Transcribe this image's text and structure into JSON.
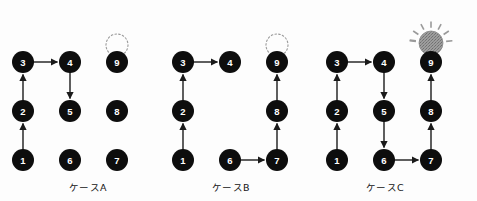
{
  "figure": {
    "background_color": "#fdfdfd",
    "node_fill": "#0d0d0d",
    "node_label_color": "#ffffff",
    "edge_color": "#1a1a1a",
    "dashed_circle_color": "#9a9a9a",
    "bulb_fill": "#8f8f8f",
    "bulb_ray_color": "#9a9a9a",
    "node_radius": 11,
    "dashed_radius": 11,
    "bulb_radius": 12
  },
  "cases": [
    {
      "id": "A",
      "label": "ケースA",
      "label_x": 88,
      "label_y": 180,
      "origin_x": 23,
      "origin_y": 160,
      "col_gap": 47,
      "row_gap": 49,
      "nodes": [
        {
          "id": "1",
          "label": "1",
          "col": 0,
          "row": 0
        },
        {
          "id": "2",
          "label": "2",
          "col": 0,
          "row": 1
        },
        {
          "id": "3",
          "label": "3",
          "col": 0,
          "row": 2
        },
        {
          "id": "4",
          "label": "4",
          "col": 1,
          "row": 2
        },
        {
          "id": "5",
          "label": "5",
          "col": 1,
          "row": 1
        },
        {
          "id": "6",
          "label": "6",
          "col": 1,
          "row": 0
        },
        {
          "id": "7",
          "label": "7",
          "col": 2,
          "row": 0
        },
        {
          "id": "8",
          "label": "8",
          "col": 2,
          "row": 1
        },
        {
          "id": "9",
          "label": "9",
          "col": 2,
          "row": 2
        }
      ],
      "edges": [
        {
          "from": "1",
          "to": "2"
        },
        {
          "from": "2",
          "to": "3"
        },
        {
          "from": "3",
          "to": "4"
        },
        {
          "from": "4",
          "to": "5"
        }
      ],
      "marker": "dashed-circle",
      "marker_node": "9"
    },
    {
      "id": "B",
      "label": "ケースB",
      "label_x": 231,
      "label_y": 180,
      "origin_x": 183,
      "origin_y": 160,
      "col_gap": 47,
      "row_gap": 49,
      "nodes": [
        {
          "id": "1",
          "label": "1",
          "col": 0,
          "row": 0
        },
        {
          "id": "2",
          "label": "2",
          "col": 0,
          "row": 1
        },
        {
          "id": "3",
          "label": "3",
          "col": 0,
          "row": 2
        },
        {
          "id": "4",
          "label": "4",
          "col": 1,
          "row": 2
        },
        {
          "id": "6",
          "label": "6",
          "col": 1,
          "row": 0
        },
        {
          "id": "7",
          "label": "7",
          "col": 2,
          "row": 0
        },
        {
          "id": "8",
          "label": "8",
          "col": 2,
          "row": 1
        },
        {
          "id": "9",
          "label": "9",
          "col": 2,
          "row": 2
        }
      ],
      "edges": [
        {
          "from": "1",
          "to": "2"
        },
        {
          "from": "2",
          "to": "3"
        },
        {
          "from": "3",
          "to": "4"
        },
        {
          "from": "6",
          "to": "7"
        },
        {
          "from": "7",
          "to": "8"
        },
        {
          "from": "8",
          "to": "9"
        }
      ],
      "marker": "dashed-circle",
      "marker_node": "9"
    },
    {
      "id": "C",
      "label": "ケースC",
      "label_x": 385,
      "label_y": 180,
      "origin_x": 337,
      "origin_y": 160,
      "col_gap": 47,
      "row_gap": 49,
      "nodes": [
        {
          "id": "1",
          "label": "1",
          "col": 0,
          "row": 0
        },
        {
          "id": "2",
          "label": "2",
          "col": 0,
          "row": 1
        },
        {
          "id": "3",
          "label": "3",
          "col": 0,
          "row": 2
        },
        {
          "id": "4",
          "label": "4",
          "col": 1,
          "row": 2
        },
        {
          "id": "5",
          "label": "5",
          "col": 1,
          "row": 1
        },
        {
          "id": "6",
          "label": "6",
          "col": 1,
          "row": 0
        },
        {
          "id": "7",
          "label": "7",
          "col": 2,
          "row": 0
        },
        {
          "id": "8",
          "label": "8",
          "col": 2,
          "row": 1
        },
        {
          "id": "9",
          "label": "9",
          "col": 2,
          "row": 2
        }
      ],
      "edges": [
        {
          "from": "1",
          "to": "2"
        },
        {
          "from": "2",
          "to": "3"
        },
        {
          "from": "3",
          "to": "4"
        },
        {
          "from": "4",
          "to": "5"
        },
        {
          "from": "5",
          "to": "6"
        },
        {
          "from": "6",
          "to": "7"
        },
        {
          "from": "7",
          "to": "8"
        },
        {
          "from": "8",
          "to": "9"
        }
      ],
      "marker": "light-bulb",
      "marker_node": "9"
    }
  ]
}
